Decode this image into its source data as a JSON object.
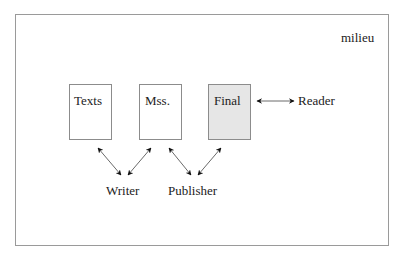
{
  "diagram": {
    "frame_label": "milieu",
    "nodes": [
      {
        "id": "texts",
        "label": "Texts",
        "shaded": false
      },
      {
        "id": "mss",
        "label": "Mss.",
        "shaded": false
      },
      {
        "id": "final",
        "label": "Final",
        "shaded": true
      },
      {
        "id": "reader",
        "label": "Reader"
      },
      {
        "id": "writer",
        "label": "Writer"
      },
      {
        "id": "publisher",
        "label": "Publisher"
      }
    ],
    "edges": [
      {
        "from": "texts",
        "to": "writer",
        "type": "bidirectional"
      },
      {
        "from": "mss",
        "to": "writer",
        "type": "bidirectional"
      },
      {
        "from": "mss",
        "to": "publisher",
        "type": "bidirectional"
      },
      {
        "from": "final",
        "to": "publisher",
        "type": "bidirectional"
      },
      {
        "from": "final",
        "to": "reader",
        "type": "bidirectional"
      }
    ],
    "colors": {
      "shaded_fill": "#e6e6e6",
      "border": "#8c8c8c"
    }
  }
}
